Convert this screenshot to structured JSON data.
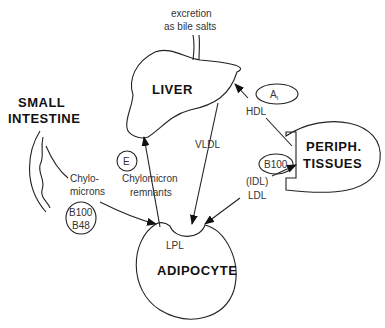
{
  "organs": {
    "liver": "LIVER",
    "small_intestine_1": "SMALL",
    "small_intestine_2": "INTESTINE",
    "periph_1": "PERIPH.",
    "periph_2": "TISSUES",
    "adipocyte": "ADIPOCYTE"
  },
  "labels": {
    "excretion_1": "excretion",
    "excretion_2": "as bile salts",
    "hdl": "HDL",
    "vldl": "VLDL",
    "chylomicrons_1": "Chylo-",
    "chylomicrons_2": "microns",
    "remnants_1": "Chylomicron",
    "remnants_2": "remnants",
    "idl": "(IDL)",
    "ldl": "LDL",
    "lpl": "LPL"
  },
  "apoproteins": {
    "a1": "A",
    "a1_sub": "I",
    "e": "E",
    "b100_periph": "B100",
    "b100_chylo": "B100",
    "b48": "B48"
  }
}
